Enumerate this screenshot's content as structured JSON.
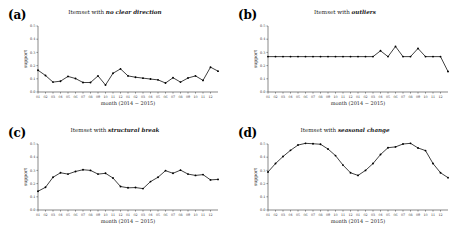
{
  "figure": {
    "title": "",
    "months": [
      "01",
      "02",
      "03",
      "04",
      "05",
      "06",
      "07",
      "08",
      "09",
      "10",
      "11",
      "12",
      "01",
      "02",
      "03",
      "04",
      "05",
      "06",
      "07",
      "08",
      "09",
      "10",
      "11",
      "12"
    ],
    "xlabel": "month (2014 − 2015)",
    "ylabel": "support",
    "yticks": [
      "0.0",
      "0.1",
      "0.2",
      "0.3",
      "0.4",
      "0.5"
    ],
    "ylim": [
      0.0,
      0.5
    ],
    "line_color": "#000000",
    "marker_color": "#000000"
  },
  "panels": [
    {
      "tag": "(a)",
      "title_prefix": "Itemset with ",
      "title_emph": "no clear direction",
      "name": "no-clear-direction"
    },
    {
      "tag": "(b)",
      "title_prefix": "Itemset with ",
      "title_emph": "outliers",
      "name": "outliers"
    },
    {
      "tag": "(c)",
      "title_prefix": "Itemset with ",
      "title_emph": "structural break",
      "name": "structural-break"
    },
    {
      "tag": "(d)",
      "title_prefix": "Itemset with ",
      "title_emph": "seasonal change",
      "name": "seasonal-change"
    }
  ],
  "chart_data": [
    {
      "type": "line",
      "panel": "a",
      "title": "Itemset with no clear direction",
      "xlabel": "month (2014 − 2015)",
      "ylabel": "support",
      "ylim": [
        0.0,
        0.5
      ],
      "yticks": [
        0.0,
        0.1,
        0.2,
        0.3,
        0.4,
        0.5
      ],
      "grid": false,
      "legend": "none",
      "categories": [
        "01",
        "02",
        "03",
        "04",
        "05",
        "06",
        "07",
        "08",
        "09",
        "10",
        "11",
        "12",
        "01",
        "02",
        "03",
        "04",
        "05",
        "06",
        "07",
        "08",
        "09",
        "10",
        "11",
        "12"
      ],
      "values": [
        0.165,
        0.125,
        0.075,
        0.082,
        0.118,
        0.102,
        0.072,
        0.072,
        0.122,
        0.053,
        0.142,
        0.175,
        0.122,
        0.112,
        0.105,
        0.098,
        0.092,
        0.068,
        0.108,
        0.075,
        0.106,
        0.122,
        0.088,
        0.188,
        0.158
      ]
    },
    {
      "type": "line",
      "panel": "b",
      "title": "Itemset with outliers",
      "xlabel": "month (2014 − 2015)",
      "ylabel": "support",
      "ylim": [
        0.0,
        0.5
      ],
      "yticks": [
        0.0,
        0.1,
        0.2,
        0.3,
        0.4,
        0.5
      ],
      "grid": false,
      "legend": "none",
      "categories": [
        "01",
        "02",
        "03",
        "04",
        "05",
        "06",
        "07",
        "08",
        "09",
        "10",
        "11",
        "12",
        "01",
        "02",
        "03",
        "04",
        "05",
        "06",
        "07",
        "08",
        "09",
        "10",
        "11",
        "12"
      ],
      "values": [
        0.268,
        0.268,
        0.268,
        0.268,
        0.268,
        0.268,
        0.268,
        0.268,
        0.268,
        0.268,
        0.268,
        0.268,
        0.268,
        0.268,
        0.268,
        0.312,
        0.268,
        0.345,
        0.268,
        0.268,
        0.33,
        0.268,
        0.268,
        0.268,
        0.155
      ]
    },
    {
      "type": "line",
      "panel": "c",
      "title": "Itemset with structural break",
      "xlabel": "month (2014 − 2015)",
      "ylabel": "support",
      "ylim": [
        0.0,
        0.5
      ],
      "yticks": [
        0.0,
        0.1,
        0.2,
        0.3,
        0.4,
        0.5
      ],
      "grid": false,
      "legend": "none",
      "categories": [
        "01",
        "02",
        "03",
        "04",
        "05",
        "06",
        "07",
        "08",
        "09",
        "10",
        "11",
        "12",
        "01",
        "02",
        "03",
        "04",
        "05",
        "06",
        "07",
        "08",
        "09",
        "10",
        "11",
        "12"
      ],
      "values": [
        0.142,
        0.172,
        0.248,
        0.282,
        0.272,
        0.292,
        0.305,
        0.3,
        0.272,
        0.278,
        0.242,
        0.178,
        0.168,
        0.17,
        0.162,
        0.215,
        0.248,
        0.298,
        0.278,
        0.302,
        0.272,
        0.262,
        0.268,
        0.228,
        0.232
      ]
    },
    {
      "type": "line",
      "panel": "d",
      "title": "Itemset with seasonal change",
      "xlabel": "month (2014 − 2015)",
      "ylabel": "support",
      "ylim": [
        0.0,
        0.5
      ],
      "yticks": [
        0.0,
        0.1,
        0.2,
        0.3,
        0.4,
        0.5
      ],
      "grid": false,
      "legend": "none",
      "categories": [
        "01",
        "02",
        "03",
        "04",
        "05",
        "06",
        "07",
        "08",
        "09",
        "10",
        "11",
        "12",
        "01",
        "02",
        "03",
        "04",
        "05",
        "06",
        "07",
        "08",
        "09",
        "10",
        "11",
        "12"
      ],
      "values": [
        0.288,
        0.352,
        0.405,
        0.452,
        0.492,
        0.505,
        0.502,
        0.498,
        0.462,
        0.412,
        0.34,
        0.282,
        0.262,
        0.3,
        0.352,
        0.42,
        0.472,
        0.478,
        0.5,
        0.505,
        0.47,
        0.45,
        0.352,
        0.282,
        0.245
      ]
    }
  ]
}
